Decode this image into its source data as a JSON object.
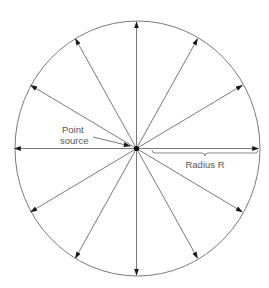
{
  "diagram": {
    "labels": {
      "point_source_line1": "Point",
      "point_source_line2": "source",
      "radius": "Radius R"
    },
    "ray_count": 12,
    "ray_angles_deg": [
      90,
      60,
      30,
      0,
      -30,
      -60,
      -90,
      -120,
      -150,
      180,
      150,
      120
    ],
    "colors": {
      "line": "#6a6a6a",
      "circle": "#7a7a7a",
      "arrowhead": "#1a1a1a",
      "source": "#000000",
      "text": "#555555"
    }
  }
}
